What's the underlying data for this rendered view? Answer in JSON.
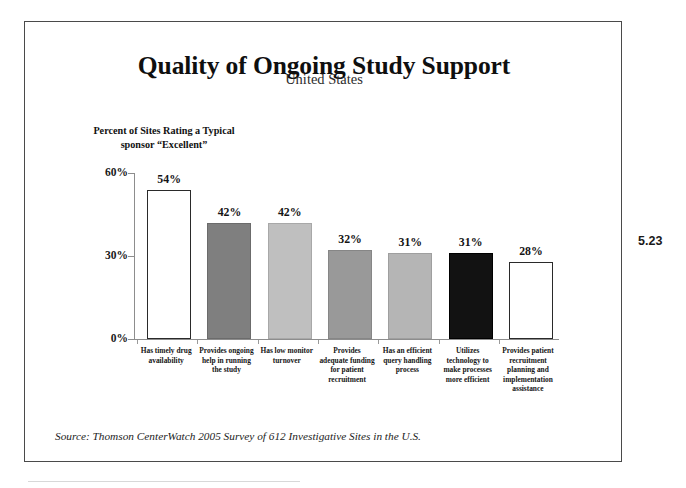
{
  "page_number": "5.23",
  "title": "Quality of Ongoing Study Support",
  "subtitle": "United States",
  "y_axis_caption_line1": "Percent of Sites Rating a Typical",
  "y_axis_caption_line2": "sponsor “Excellent”",
  "source_note": "Source:  Thomson CenterWatch 2005 Survey of 612 Investigative Sites in the U.S.",
  "chart_data": {
    "type": "bar",
    "title": "Quality of Ongoing Study Support",
    "subtitle": "United States",
    "xlabel": "",
    "ylabel": "Percent of Sites Rating a Typical sponsor “Excellent”",
    "ylim": [
      0,
      60
    ],
    "yticks": [
      0,
      30,
      60
    ],
    "ytick_labels": [
      "0%",
      "30%",
      "60%"
    ],
    "grid": false,
    "legend": "none",
    "categories": [
      "Has timely drug availability",
      "Provides ongoing help in running the study",
      "Has low monitor turnover",
      "Provides adequate funding for patient recruitment",
      "Has an efficient query handling process",
      "Utilizes technology to make processes more efficient",
      "Provides patient recruitment planning and implementation assistance"
    ],
    "category_label_lines": [
      [
        "Has timely drug",
        "availability"
      ],
      [
        "Provides ongoing",
        "help in running",
        "the study"
      ],
      [
        "Has low monitor",
        "turnover"
      ],
      [
        "Provides",
        "adequate funding",
        "for patient",
        "recruitment"
      ],
      [
        "Has an efficient",
        "query handling",
        "process"
      ],
      [
        "Utilizes",
        "technology to",
        "make processes",
        "more efficient"
      ],
      [
        "Provides patient",
        "recruitment",
        "planning and",
        "implementation",
        "assistance"
      ]
    ],
    "values": [
      54,
      42,
      42,
      32,
      31,
      31,
      28
    ],
    "value_labels": [
      "54%",
      "42%",
      "42%",
      "32%",
      "31%",
      "31%",
      "28%"
    ],
    "bar_colors": [
      "#ffffff",
      "#7f7f7f",
      "#bfbfbf",
      "#999999",
      "#b5b5b5",
      "#121212",
      "#ffffff"
    ],
    "bar_border_colors": [
      "#2a2a2a",
      "#6b6b6b",
      "#a8a8a8",
      "#868686",
      "#9f9f9f",
      "#000000",
      "#2a2a2a"
    ]
  }
}
